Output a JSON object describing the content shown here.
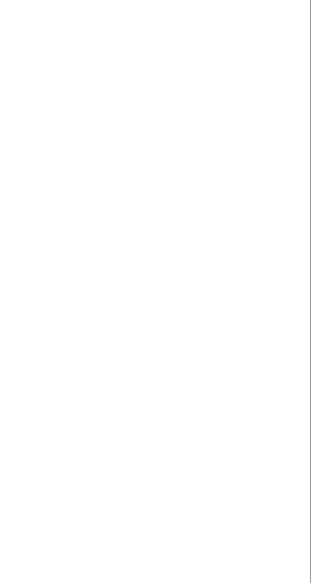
{
  "figure": {
    "type": "eeg-comparison",
    "top_panel": {
      "description": "Electrocerebral silence - flat traces",
      "channels": [
        {
          "label": "Fp2-C4",
          "main": "Fp",
          "s1": "2",
          "mid": "-C",
          "s2": "4",
          "x": 53
        },
        {
          "label": "C4-O2",
          "main": "C",
          "s1": "4",
          "mid": "-O",
          "s2": "2",
          "x": 76
        },
        {
          "label": "Fp2-T4",
          "main": "Fp",
          "s1": "2",
          "mid": "-T",
          "s2": "4",
          "x": 101
        },
        {
          "label": "T4-O2",
          "main": "T",
          "s1": "4",
          "mid": "-O",
          "s2": "2",
          "x": 123
        },
        {
          "label": "Fp1-C3",
          "main": "Fp",
          "s1": "1",
          "mid": "-C",
          "s2": "3",
          "x": 147
        },
        {
          "label": "C3-O1",
          "main": "C",
          "s1": "3",
          "mid": "-O",
          "s2": "1",
          "x": 169
        },
        {
          "label": "Fp1-T3",
          "main": "Fp",
          "s1": "1",
          "mid": "-T",
          "s2": "3",
          "x": 194
        },
        {
          "label": "T3-O1",
          "main": "T",
          "s1": "3",
          "mid": "-O",
          "s2": "1",
          "x": 217
        },
        {
          "label": "EKG",
          "main": "EKG",
          "s1": "",
          "mid": "",
          "s2": "",
          "x": 240
        }
      ],
      "ekg_trace_x": 265
    },
    "bottom_panel": {
      "description": "Normal EEG activity",
      "ekg_label": "EKG",
      "trace_x": [
        35,
        67,
        97,
        125,
        152,
        180,
        210,
        238,
        266
      ]
    }
  }
}
